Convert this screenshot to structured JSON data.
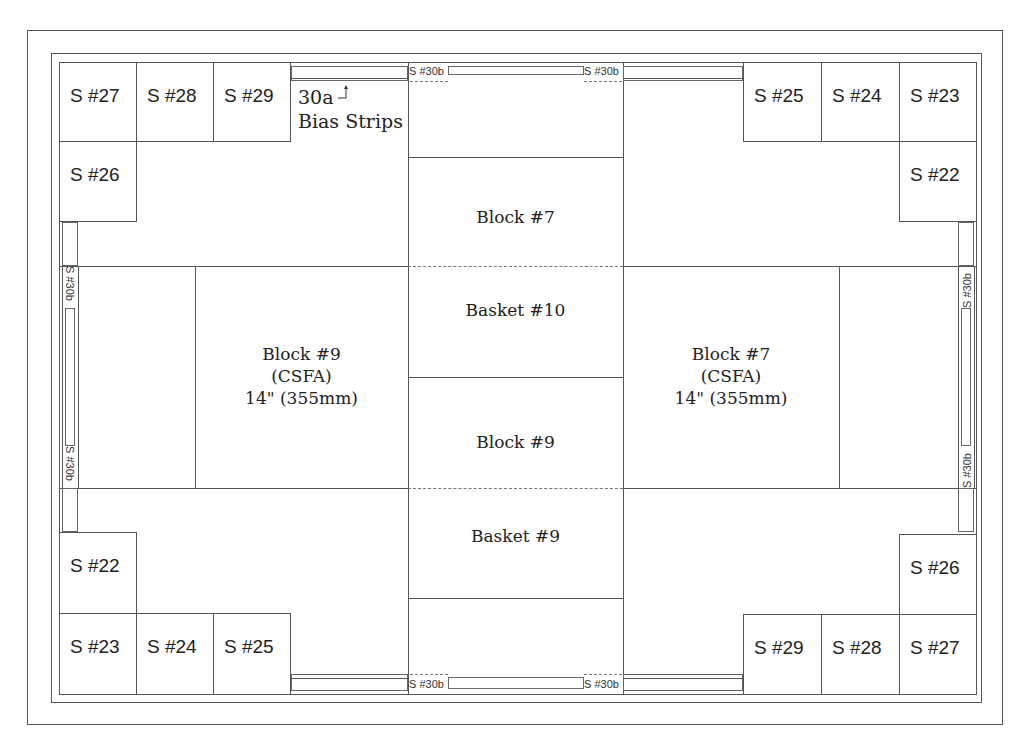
{
  "diagram": {
    "corner_squares": {
      "top_left": [
        "S #27",
        "S #28",
        "S #29"
      ],
      "top_left_below": "S #26",
      "top_right": [
        "S #25",
        "S #24",
        "S #23"
      ],
      "top_right_below": "S #22",
      "bottom_left_above": "S #22",
      "bottom_left": [
        "S #23",
        "S #24",
        "S #25"
      ],
      "bottom_right_above": "S #26",
      "bottom_right": [
        "S #29",
        "S #28",
        "S #27"
      ]
    },
    "annotation": {
      "code": "30a",
      "text": "Bias Strips"
    },
    "strip_label": "S #30b",
    "center_column": [
      {
        "label": "Block #7"
      },
      {
        "label": "Basket #10"
      },
      {
        "label": "Block #9"
      },
      {
        "label": "Basket #9"
      }
    ],
    "left_big_block": {
      "line1": "Block #9",
      "line2": "(CSFA)",
      "line3": "14\" (355mm)"
    },
    "right_big_block": {
      "line1": "Block #7",
      "line2": "(CSFA)",
      "line3": "14\" (355mm)"
    },
    "colors": {
      "line": "#555555",
      "dash": "#777777",
      "text": "#222222",
      "background": "#ffffff"
    }
  }
}
